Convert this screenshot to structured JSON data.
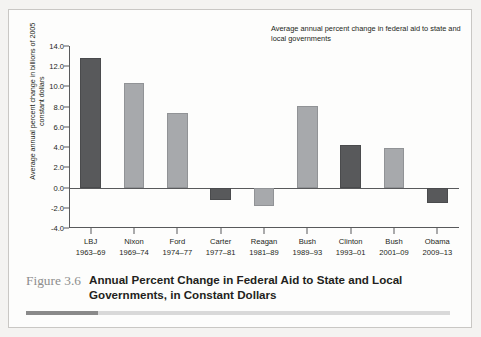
{
  "figure": {
    "number_label": "Figure 3.6",
    "title": "Annual Percent Change in Federal Aid to State and Local Governments, in Constant Dollars"
  },
  "legend": {
    "text": "Average annual percent change in federal aid to state and local governments"
  },
  "axis": {
    "y_title_line1": "Average annual percent change in billions of",
    "y_title_line2": "2005 constant dollars"
  },
  "colors": {
    "bar_dark": "#58595b",
    "bar_light": "#a7a9ac",
    "axis": "#58595b",
    "text": "#231f20",
    "fignum": "#8d8d8d",
    "panel": "#fdfdfc",
    "page": "#f4f3f1"
  },
  "chart_data": {
    "type": "bar",
    "title": "Average annual percent change in federal aid to state and local governments",
    "xlabel": "",
    "ylabel": "Average annual percent change in billions of 2005 constant dollars",
    "ylim": [
      -4.0,
      14.0
    ],
    "yticks": [
      "14.0",
      "12.0",
      "10.0",
      "8.0",
      "6.0",
      "4.0",
      "2.0",
      "0.0",
      "-2.0",
      "-4.0"
    ],
    "ytick_values": [
      14.0,
      12.0,
      10.0,
      8.0,
      6.0,
      4.0,
      2.0,
      0.0,
      -2.0,
      -4.0
    ],
    "grid": false,
    "legend_position": "top-right",
    "categories": [
      "LBJ",
      "Nixon",
      "Ford",
      "Carter",
      "Reagan",
      "Bush",
      "Clinton",
      "Bush",
      "Obama"
    ],
    "category_years": [
      "1963–69",
      "1969–74",
      "1974–77",
      "1977–81",
      "1981–89",
      "1989–93",
      "1993–01",
      "2001–09",
      "2009–13"
    ],
    "values": [
      12.8,
      10.3,
      7.4,
      -1.2,
      -1.8,
      8.1,
      4.2,
      3.9,
      -1.5
    ],
    "bar_shades": [
      "dark",
      "light",
      "light",
      "dark",
      "light",
      "light",
      "dark",
      "light",
      "dark"
    ]
  }
}
